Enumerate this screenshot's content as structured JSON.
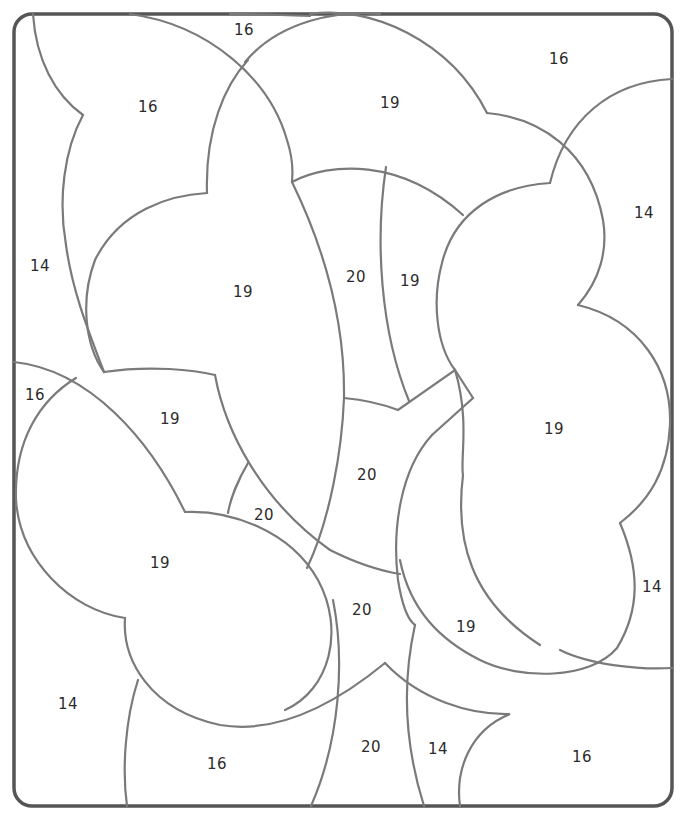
{
  "puzzle": {
    "type": "color-by-number",
    "frame": {
      "x": 14,
      "y": 14,
      "width": 658,
      "height": 792,
      "corner_radius": 18
    },
    "line_color": "#7a7a7a",
    "frame_color": "#555555",
    "regions": [
      {
        "id": "r1",
        "label": "16",
        "x": 244,
        "y": 30
      },
      {
        "id": "r2",
        "label": "16",
        "x": 148,
        "y": 107
      },
      {
        "id": "r3",
        "label": "19",
        "x": 390,
        "y": 103
      },
      {
        "id": "r4",
        "label": "16",
        "x": 559,
        "y": 59
      },
      {
        "id": "r5",
        "label": "14",
        "x": 644,
        "y": 213
      },
      {
        "id": "r6",
        "label": "14",
        "x": 40,
        "y": 266
      },
      {
        "id": "r7",
        "label": "19",
        "x": 243,
        "y": 292
      },
      {
        "id": "r8",
        "label": "20",
        "x": 356,
        "y": 277
      },
      {
        "id": "r9",
        "label": "19",
        "x": 410,
        "y": 281
      },
      {
        "id": "r10",
        "label": "16",
        "x": 35,
        "y": 395
      },
      {
        "id": "r11",
        "label": "19",
        "x": 170,
        "y": 419
      },
      {
        "id": "r12",
        "label": "19",
        "x": 554,
        "y": 429
      },
      {
        "id": "r13",
        "label": "20",
        "x": 367,
        "y": 475
      },
      {
        "id": "r14",
        "label": "20",
        "x": 264,
        "y": 515
      },
      {
        "id": "r15",
        "label": "19",
        "x": 160,
        "y": 563
      },
      {
        "id": "r16",
        "label": "14",
        "x": 652,
        "y": 587
      },
      {
        "id": "r17",
        "label": "20",
        "x": 362,
        "y": 610
      },
      {
        "id": "r18",
        "label": "19",
        "x": 466,
        "y": 627
      },
      {
        "id": "r19",
        "label": "14",
        "x": 68,
        "y": 704
      },
      {
        "id": "r20",
        "label": "16",
        "x": 217,
        "y": 764
      },
      {
        "id": "r21",
        "label": "20",
        "x": 371,
        "y": 747
      },
      {
        "id": "r22",
        "label": "14",
        "x": 438,
        "y": 749
      },
      {
        "id": "r23",
        "label": "16",
        "x": 582,
        "y": 757
      }
    ]
  }
}
